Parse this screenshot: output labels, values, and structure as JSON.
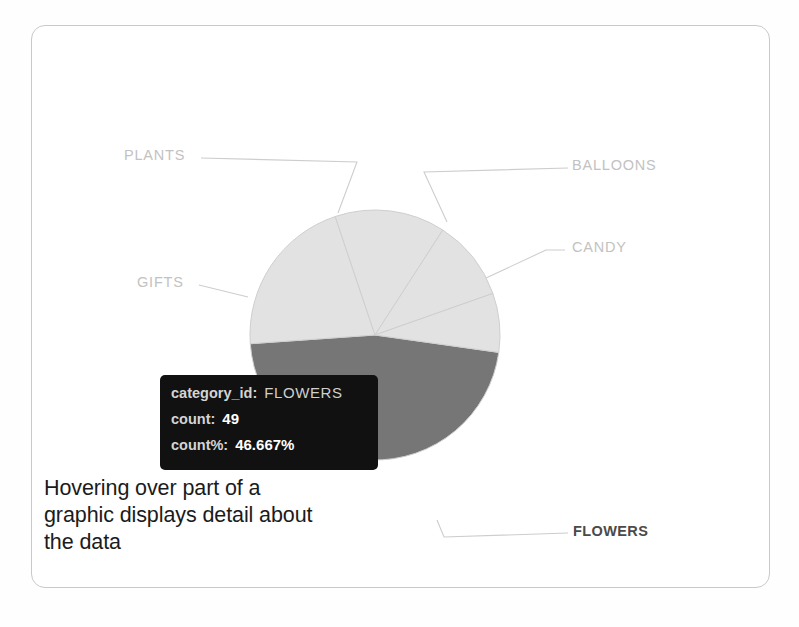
{
  "figure": {
    "frame_color": "#c9c9c9",
    "background": "#ffffff"
  },
  "annotation": {
    "line1": "Hovering over part of a",
    "line2": "graphic displays detail about",
    "line3": "the data"
  },
  "figure_caption": {
    "text": ""
  },
  "tooltip": {
    "rows": [
      {
        "key": "category_id:",
        "value": "FLOWERS",
        "style": "light"
      },
      {
        "key": "count:",
        "value": "49",
        "style": "bold"
      },
      {
        "key": "count%:",
        "value": "46.667%",
        "style": "bold"
      }
    ],
    "background": "#111111"
  },
  "chart_data": {
    "type": "pie",
    "title": "",
    "legend_position": "outside-labels",
    "grid": false,
    "value_field": "count",
    "percent_field": "count%",
    "category_field": "category_id",
    "total": 105,
    "highlighted_slice": "FLOWERS",
    "colors": {
      "default_slice": "#e2e2e2",
      "highlighted_slice": "#767676",
      "slice_border": "#cfcfcf",
      "label_text": "#c2c2c2",
      "highlighted_label_text": "#4a4a4a",
      "leader_line": "#cdcdcd"
    },
    "slices": [
      {
        "label": "FLOWERS",
        "count": 49,
        "percent": 46.667,
        "highlighted": true
      },
      {
        "label": "GIFTS",
        "count": 22,
        "percent": 20.952,
        "highlighted": false
      },
      {
        "label": "PLANTS",
        "count": 15,
        "percent": 14.286,
        "highlighted": false
      },
      {
        "label": "BALLOONS",
        "count": 11,
        "percent": 10.476,
        "highlighted": false
      },
      {
        "label": "CANDY",
        "count": 8,
        "percent": 7.619,
        "highlighted": false
      }
    ],
    "categories": [
      "FLOWERS",
      "GIFTS",
      "PLANTS",
      "BALLOONS",
      "CANDY"
    ],
    "values": [
      49,
      22,
      15,
      11,
      8
    ],
    "percents": [
      46.667,
      20.952,
      14.286,
      10.476,
      7.619
    ]
  }
}
